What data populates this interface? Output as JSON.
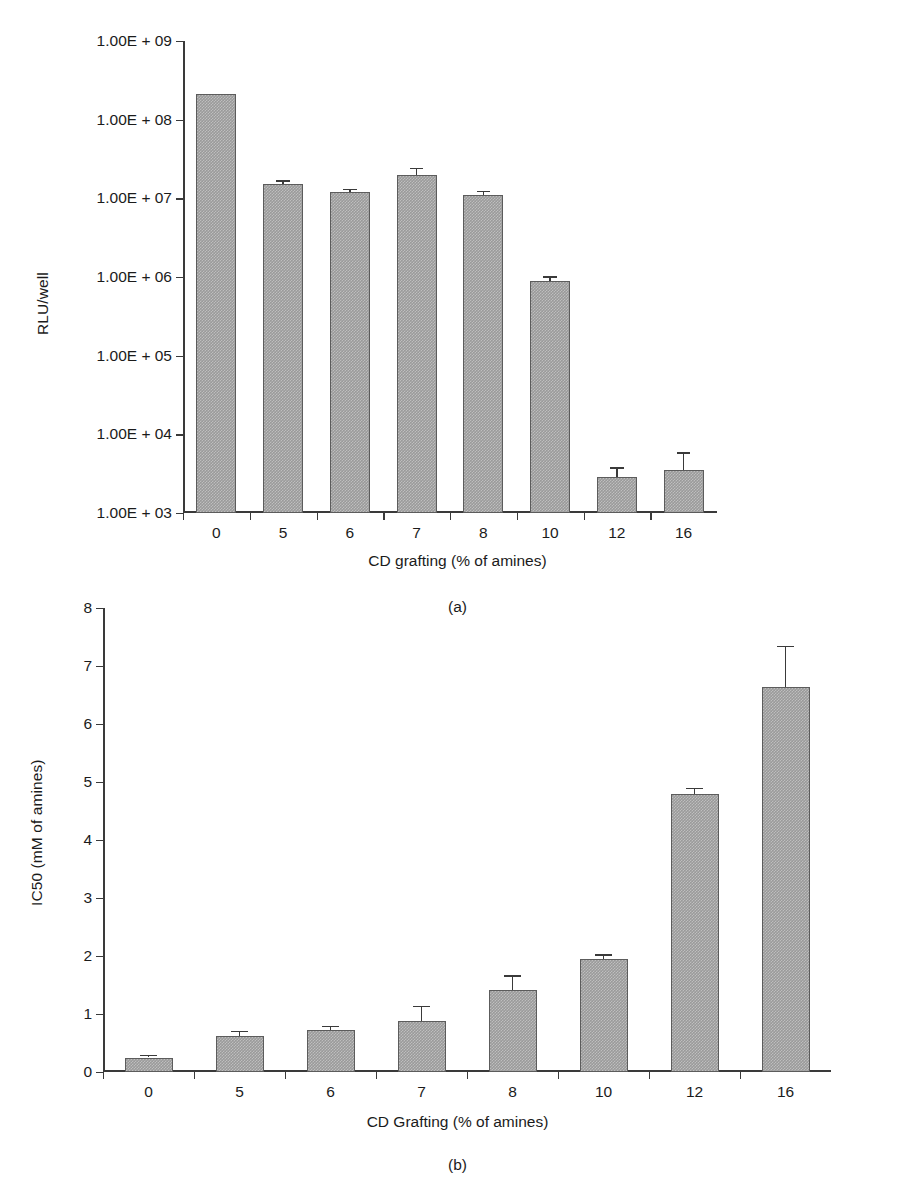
{
  "figure": {
    "background": "#ffffff",
    "bar_fill": "#9a9a9a",
    "bar_stroke": "#5c5c5c",
    "axis_color": "#3a3a3a"
  },
  "chart_data": [
    {
      "type": "bar",
      "panel": "a",
      "title": "",
      "caption": "(a)",
      "xlabel": "CD grafting (% of amines)",
      "ylabel": "RLU/well",
      "yscale": "log",
      "ylim": [
        1000,
        1000000000
      ],
      "ytick_labels": [
        "1.00E + 09",
        "1.00E + 08",
        "1.00E + 07",
        "1.00E + 06",
        "1.00E + 05",
        "1.00E + 04",
        "1.00E + 03"
      ],
      "ytick_values": [
        1000000000,
        100000000,
        10000000,
        1000000,
        100000,
        10000,
        1000
      ],
      "grid": false,
      "legend": null,
      "categories": [
        "0",
        "5",
        "6",
        "7",
        "8",
        "10",
        "12",
        "16"
      ],
      "values": [
        210000000,
        15000000,
        12000000,
        20000000,
        11000000,
        900000,
        2900,
        3500
      ],
      "errors_up": [
        0,
        2000000,
        1200000,
        4500000,
        1500000,
        120000,
        900,
        2400
      ],
      "errors_down": [
        0,
        2000000,
        1200000,
        4500000,
        1500000,
        120000,
        900,
        2400
      ]
    },
    {
      "type": "bar",
      "panel": "b",
      "title": "",
      "caption": "(b)",
      "xlabel": "CD Grafting (% of amines)",
      "ylabel": "IC50 (mM of amines)",
      "yscale": "linear",
      "ylim": [
        0,
        8
      ],
      "ytick_labels": [
        "8",
        "7",
        "6",
        "5",
        "4",
        "3",
        "2",
        "1",
        "0"
      ],
      "ytick_values": [
        8,
        7,
        6,
        5,
        4,
        3,
        2,
        1,
        0
      ],
      "grid": false,
      "legend": null,
      "categories": [
        "0",
        "5",
        "6",
        "7",
        "8",
        "10",
        "12",
        "16"
      ],
      "values": [
        0.25,
        0.62,
        0.72,
        0.88,
        1.42,
        1.95,
        4.8,
        6.63
      ],
      "errors_up": [
        0.05,
        0.09,
        0.08,
        0.26,
        0.25,
        0.08,
        0.1,
        0.72
      ],
      "errors_down": [
        0.05,
        0.09,
        0.08,
        0.26,
        0.25,
        0.08,
        0.1,
        0.72
      ]
    }
  ],
  "footer": {
    "cutoff_text": ""
  }
}
